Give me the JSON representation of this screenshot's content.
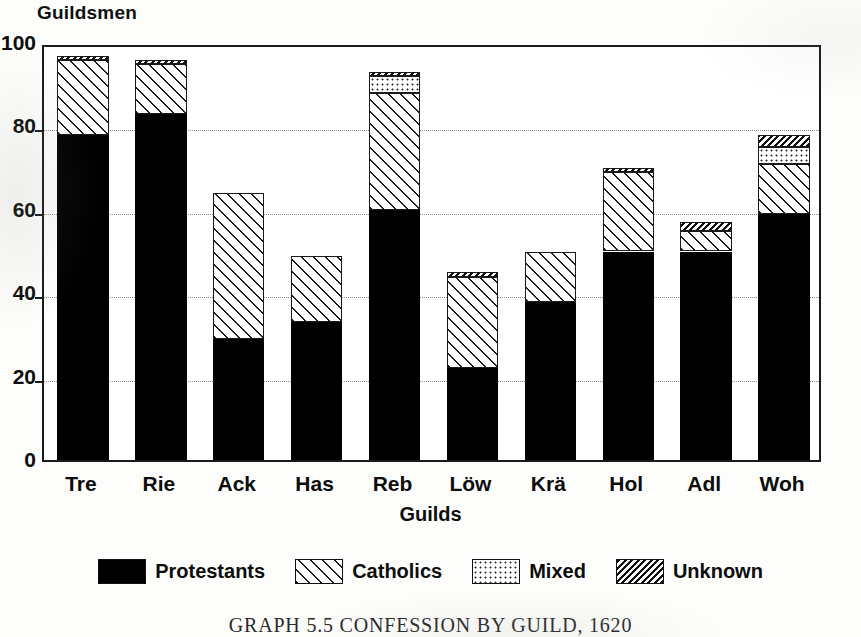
{
  "chart_data": {
    "type": "bar",
    "subtype": "stacked",
    "title": "",
    "ylabel": "Guildsmen",
    "xlabel": "Guilds",
    "ylim": [
      0,
      100
    ],
    "grid": true,
    "yticks": [
      0,
      20,
      40,
      60,
      80,
      100
    ],
    "ytick_labels": [
      "0",
      "20",
      "40",
      "60",
      "80",
      "100"
    ],
    "legend_position": "bottom",
    "categories": [
      "Tre",
      "Rie",
      "Ack",
      "Has",
      "Reb",
      "Löw",
      "Krä",
      "Hol",
      "Adl",
      "Woh"
    ],
    "series": [
      {
        "name": "Protestants",
        "pattern": "solid",
        "values": [
          78,
          83,
          29,
          33,
          60,
          22,
          38,
          50,
          50,
          59
        ]
      },
      {
        "name": "Catholics",
        "pattern": "diagonal-hatch",
        "values": [
          18,
          12,
          35,
          16,
          28,
          22,
          12,
          19,
          5,
          12
        ]
      },
      {
        "name": "Mixed",
        "pattern": "dotted",
        "values": [
          0,
          0,
          0,
          0,
          4,
          0,
          0,
          0,
          0,
          4
        ]
      },
      {
        "name": "Unknown",
        "pattern": "dense-hatch",
        "values": [
          1,
          1,
          0,
          0,
          1,
          1,
          0,
          1,
          2,
          3
        ]
      }
    ],
    "totals": [
      97,
      96,
      64,
      49,
      93,
      45,
      50,
      70,
      57,
      78
    ]
  },
  "caption": "GRAPH 5.5   CONFESSION BY GUILD, 1620",
  "colors": {
    "ink": "#111111",
    "paper": "#ffffff",
    "grid": "#8c8c8c"
  }
}
